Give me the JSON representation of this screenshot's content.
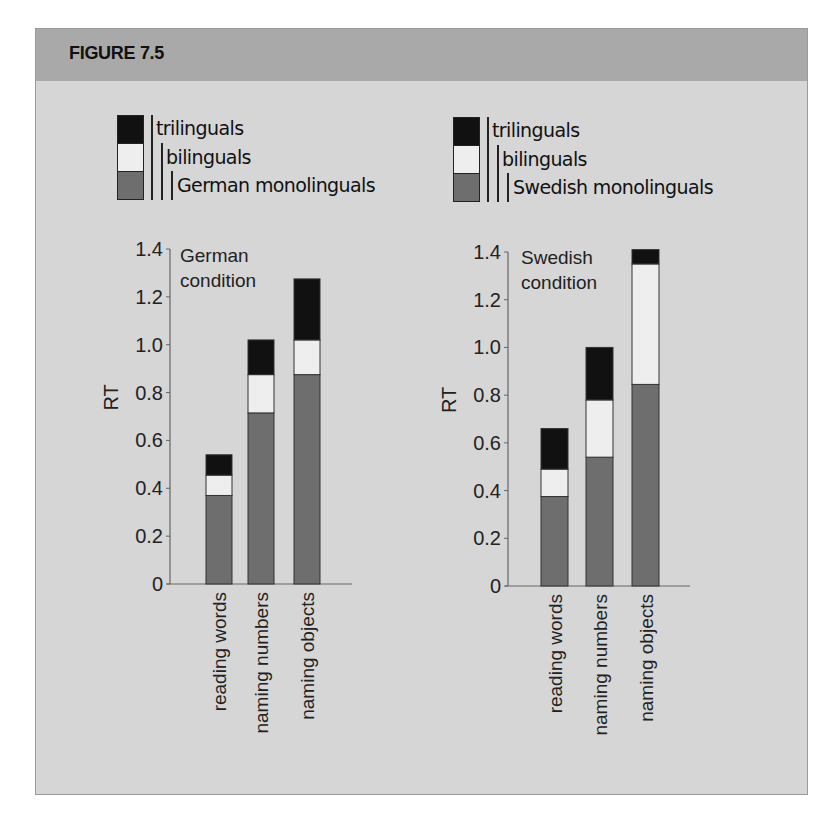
{
  "figure": {
    "title": "FIGURE 7.5",
    "colors": {
      "frame_bg": "#d6d6d6",
      "header_bg": "#a9a9a9",
      "monolinguals": "#6e6e6e",
      "bilinguals": "#eeeeee",
      "trilinguals": "#111111"
    }
  },
  "legends": [
    {
      "items": [
        {
          "label": "trilinguals",
          "color": "#111111"
        },
        {
          "label": "bilinguals",
          "color": "#eeeeee"
        },
        {
          "label": "German monolinguals",
          "color": "#6e6e6e"
        }
      ]
    },
    {
      "items": [
        {
          "label": "trilinguals",
          "color": "#111111"
        },
        {
          "label": "bilinguals",
          "color": "#eeeeee"
        },
        {
          "label": "Swedish monolinguals",
          "color": "#6e6e6e"
        }
      ]
    }
  ],
  "chart_data": [
    {
      "type": "bar",
      "stacked": true,
      "title": "German condition",
      "title_lines": [
        "German",
        "condition"
      ],
      "xlabel": "",
      "ylabel": "RT",
      "ylim": [
        0,
        1.4
      ],
      "yticks": [
        "0",
        "0.2",
        "0.4",
        "0.6",
        "0.8",
        "1.0",
        "1.2",
        "1.4"
      ],
      "categories": [
        "reading words",
        "naming numbers",
        "naming objects"
      ],
      "series": [
        {
          "name": "German monolinguals",
          "values": [
            0.37,
            0.715,
            0.875
          ]
        },
        {
          "name": "bilinguals",
          "values": [
            0.455,
            0.875,
            1.02
          ]
        },
        {
          "name": "trilinguals",
          "values": [
            0.54,
            1.02,
            1.275
          ]
        }
      ],
      "note": "Series values are cumulative bar heights (overlaid segments): each group's bar extends from 0 to its value.",
      "grid": false,
      "legend_position": "top"
    },
    {
      "type": "bar",
      "stacked": true,
      "title": "Swedish condition",
      "title_lines": [
        "Swedish",
        "condition"
      ],
      "xlabel": "",
      "ylabel": "RT",
      "ylim": [
        0,
        1.4
      ],
      "yticks": [
        "0",
        "0.2",
        "0.4",
        "0.6",
        "0.8",
        "1.0",
        "1.2",
        "1.4"
      ],
      "categories": [
        "reading words",
        "naming numbers",
        "naming objects"
      ],
      "series": [
        {
          "name": "Swedish monolinguals",
          "values": [
            0.375,
            0.54,
            0.845
          ]
        },
        {
          "name": "bilinguals",
          "values": [
            0.49,
            0.78,
            1.35
          ]
        },
        {
          "name": "trilinguals",
          "values": [
            0.66,
            1.0,
            1.41
          ]
        }
      ],
      "note": "Series values are cumulative bar heights (overlaid segments): each group's bar extends from 0 to its value.",
      "grid": false,
      "legend_position": "top"
    }
  ]
}
